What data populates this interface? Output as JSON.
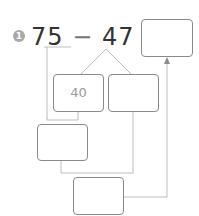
{
  "problem": {
    "number": "1",
    "minuend": "75",
    "operator": "−",
    "subtrahend": "47",
    "equals": "=",
    "answer": ""
  },
  "decomposition": {
    "box_tens": "40",
    "box_ones": "",
    "box_intermediate": "",
    "box_final": ""
  },
  "colors": {
    "line": "#bdbdbd",
    "box_border": "#8a8a8a",
    "badge": "#a9a9a9",
    "text": "#333333"
  }
}
